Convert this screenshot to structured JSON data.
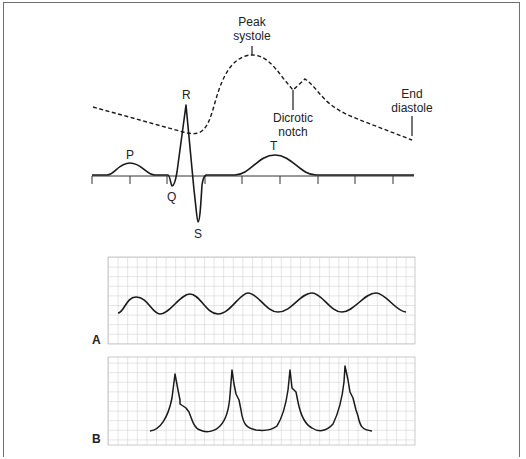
{
  "figure": {
    "top_diagram": {
      "description": "ECG waveform with superimposed arterial pressure waveform",
      "ecg_labels": [
        "P",
        "Q",
        "R",
        "S",
        "T"
      ],
      "pressure_labels": {
        "peak_systole_line1": "Peak",
        "peak_systole_line2": "systole",
        "dicrotic_notch_line1": "Dicrotic",
        "dicrotic_notch_line2": "notch",
        "end_diastole_line1": "End",
        "end_diastole_line2": "diastole"
      },
      "time_axis_ticks": 9
    },
    "panel_a": {
      "label": "A",
      "description": "Damped sinusoidal arterial pressure trace on grid paper",
      "cycles": 5
    },
    "panel_b": {
      "label": "B",
      "description": "Arterial pressure trace with sharp systolic peaks on grid paper",
      "cycles": 4
    }
  },
  "colors": {
    "trace": "#1a1a1a",
    "grid": "#b8b8b8",
    "frame": "#6f6f6f"
  }
}
